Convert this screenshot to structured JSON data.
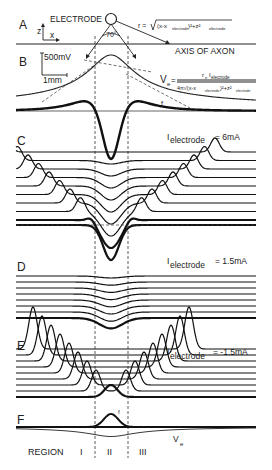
{
  "figure": {
    "panels": {
      "A": {
        "label": "A",
        "electrode_label": "ELECTRODE",
        "angle_label": "70°",
        "axis_z": "z",
        "axis_x": "x",
        "distance_formula": {
          "lhs": "r =",
          "term1": "(x-x",
          "sub1": "electrode",
          "term2": ")²+z²",
          "sub2": "electrode"
        },
        "axon_label": "AXIS OF AXON"
      },
      "B": {
        "label": "B",
        "scale_voltage": "500mV",
        "scale_distance": "1mm",
        "ve_lhs": "V",
        "ve_lhs_sub": "e",
        "ve_numerator": "r",
        "ve_numerator_sub1": "e",
        "ve_numerator_I": "I",
        "ve_numerator_sub2": "electrode",
        "ve_denominator": "4π√(x-x",
        "ve_den_sub1": "electrode",
        "ve_den_mid": ")²+z²",
        "ve_den_sub2": "electrode",
        "f_label": "f"
      },
      "C": {
        "label": "C",
        "current_label": "I",
        "current_sub": "electrode",
        "current_value": "= 6mA",
        "trace_count": 9
      },
      "D": {
        "label": "D",
        "current_label": "I",
        "current_sub": "electrode",
        "current_value": "= 1.5mA",
        "trace_count": 8
      },
      "E": {
        "label": "E",
        "current_label": "I",
        "current_sub": "electrode",
        "current_value": "= -1.5mA",
        "trace_count": 9
      },
      "F": {
        "label": "F",
        "f_label": "f",
        "ve_label": "V",
        "ve_sub": "e"
      }
    },
    "regions": {
      "prefix": "REGION",
      "labels": [
        "I",
        "II",
        "III"
      ]
    }
  }
}
